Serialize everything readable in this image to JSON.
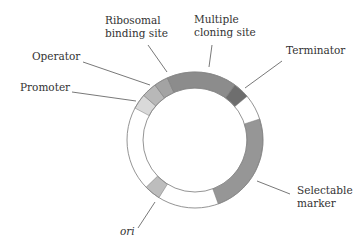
{
  "diagram": {
    "center": [
      195,
      140
    ],
    "outer_radius": 68,
    "inner_radius": 52,
    "ring_stroke": "#888888",
    "segments": [
      {
        "name": "Promoter",
        "start": -62,
        "end": -49,
        "color": "#d9d9d9"
      },
      {
        "name": "Operator",
        "start": -49,
        "end": -36,
        "color": "#b8b8b8"
      },
      {
        "name": "Ribosomal binding site",
        "start": -36,
        "end": -24,
        "color": "#a3a3a3"
      },
      {
        "name": "Multiple cloning site",
        "start": -24,
        "end": 36,
        "color": "#8c8c8c"
      },
      {
        "name": "Terminator",
        "start": 36,
        "end": 50,
        "color": "#6e6e6e"
      },
      {
        "name": "Selectable marker",
        "start": 72,
        "end": 160,
        "color": "#969696"
      },
      {
        "name": "ori",
        "start": 212,
        "end": 226,
        "color": "#bdbdbd"
      }
    ],
    "labels": {
      "ribosomal_line1": "Ribosomal",
      "ribosomal_line2": "binding site",
      "mcs_line1": "Multiple",
      "mcs_line2": "cloning site",
      "operator": "Operator",
      "promoter": "Promoter",
      "terminator": "Terminator",
      "selectable_line1": "Selectable",
      "selectable_line2": "marker",
      "ori": "ori"
    }
  }
}
